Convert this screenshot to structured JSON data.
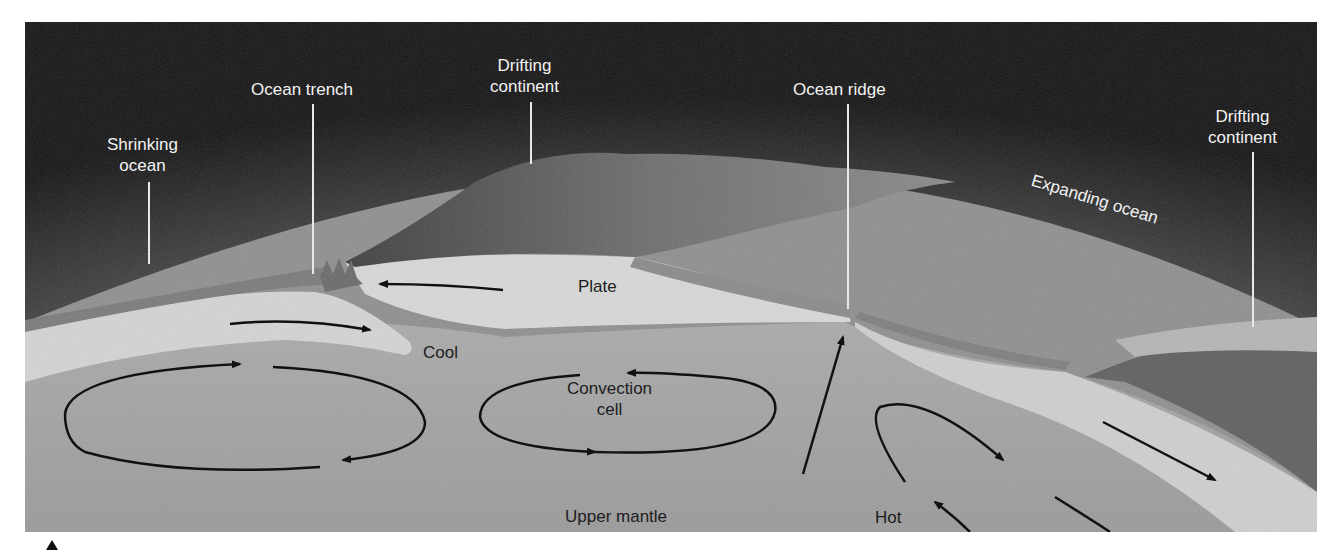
{
  "figure": {
    "type": "plate-tectonics-cross-section",
    "labels": {
      "shrinking_ocean": [
        "Shrinking",
        "ocean"
      ],
      "ocean_trench": "Ocean trench",
      "drifting_continent_left": [
        "Drifting",
        "continent"
      ],
      "ocean_ridge": "Ocean ridge",
      "drifting_continent_right": [
        "Drifting",
        "continent"
      ],
      "expanding_ocean": "Expanding ocean",
      "plate": "Plate",
      "cool": "Cool",
      "convection_cell": [
        "Convection",
        "cell"
      ],
      "upper_mantle": "Upper mantle",
      "hot": "Hot"
    },
    "colors": {
      "sky_dark": "#1a1a1a",
      "sky_glow": "#cfcfcf",
      "ocean": "#9a9a9a",
      "plate": "#d6d6d6",
      "mantle": "#a6a6a6",
      "continent": "#5a5a5a",
      "arrow": "#111111",
      "label_light": "#f2f2f2"
    }
  }
}
